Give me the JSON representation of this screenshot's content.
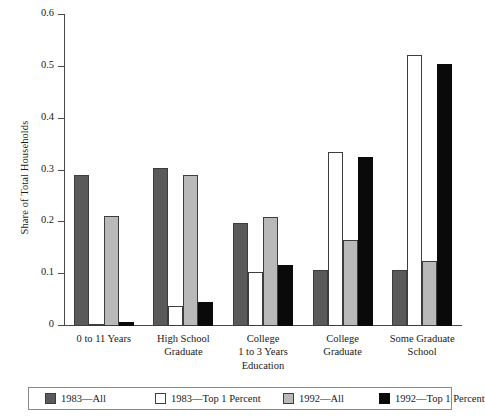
{
  "chart_data": {
    "type": "bar",
    "title": "",
    "subtitle": "",
    "xlabel": "Education",
    "ylabel": "Share of Total Households",
    "ylim": [
      0,
      0.6
    ],
    "ytick_labels": [
      "0",
      "0.1",
      "0.2",
      "0.3",
      "0.4",
      "0.5",
      "0.6"
    ],
    "ytick_values": [
      0,
      0.1,
      0.2,
      0.3,
      0.4,
      0.5,
      0.6
    ],
    "grid": false,
    "legend_position": "bottom",
    "categories": [
      "0 to 11 Years",
      "High School\nGraduate",
      "College\n1 to 3 Years",
      "College\nGraduate",
      "Some Graduate\nSchool"
    ],
    "category_lines": [
      [
        "0 to 11 Years"
      ],
      [
        "High School",
        "Graduate"
      ],
      [
        "College",
        "1 to 3 Years"
      ],
      [
        "College",
        "Graduate"
      ],
      [
        "Some Graduate",
        "School"
      ]
    ],
    "series": [
      {
        "name": "1983—All",
        "color": "#5a5a5a",
        "values": [
          0.291,
          0.305,
          0.199,
          0.109,
          0.109
        ]
      },
      {
        "name": "1983—Top 1 Percent",
        "color": "#ffffff",
        "values": [
          0.002,
          0.039,
          0.104,
          0.335,
          0.522
        ]
      },
      {
        "name": "1992—All",
        "color": "#b9b9b9",
        "values": [
          0.213,
          0.291,
          0.21,
          0.166,
          0.126
        ]
      },
      {
        "name": "1992—Top 1 Percent",
        "color": "#0a0a0a",
        "values": [
          0.008,
          0.047,
          0.117,
          0.327,
          0.505
        ]
      }
    ]
  }
}
